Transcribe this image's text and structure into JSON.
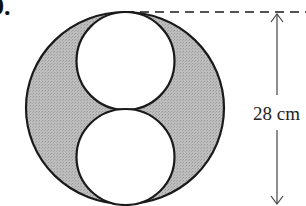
{
  "figure": {
    "question_number": "9.",
    "dimension_label": "28 cm",
    "colors": {
      "shaded": "#b5b5b5",
      "stroke": "#1a1a1a",
      "small_circle_fill": "#ffffff",
      "dimension_line": "#444444"
    },
    "geometry": {
      "large_circle": {
        "cx": 125,
        "cy": 108,
        "rx": 99,
        "ry": 96
      },
      "small_circle_top": {
        "cx": 125.5,
        "cy": 61,
        "rx": 49,
        "ry": 49
      },
      "small_circle_bottom": {
        "cx": 125.5,
        "cy": 157,
        "rx": 49,
        "ry": 48
      },
      "dashed_line": {
        "x1": 125,
        "y1": 12,
        "x2": 306,
        "y2": 12
      },
      "dimension_arrow": {
        "x": 277,
        "y_top": 13,
        "y_bottom": 204
      }
    }
  }
}
